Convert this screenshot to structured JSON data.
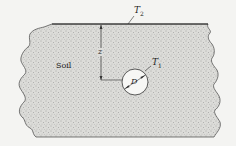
{
  "diagram": {
    "type": "buried-cylinder-in-soil",
    "labels": {
      "surface_temp": "T",
      "surface_temp_sub": "2",
      "pipe_temp": "T",
      "pipe_temp_sub": "1",
      "depth": "z",
      "diameter": "D",
      "medium": "Soil"
    },
    "colors": {
      "background": "#f4f4f2",
      "soil_fill": "#d9d9d6",
      "stipple": "#6a6a6a",
      "outline": "#333333",
      "pipe_fill": "#f7f7f5"
    },
    "geometry": {
      "surface_y": 24,
      "surface_x_start": 52,
      "surface_x_end": 208,
      "pipe_center": [
        135,
        82
      ],
      "pipe_radius": 13,
      "depth_line_x": 101
    }
  }
}
